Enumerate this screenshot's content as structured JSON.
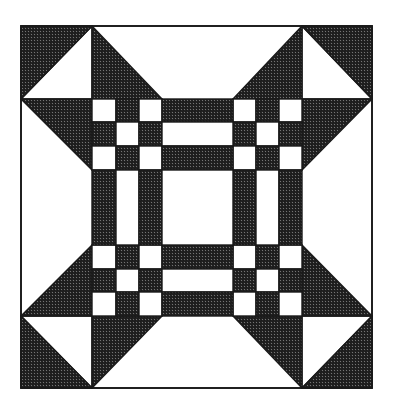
{
  "figure": {
    "canvas": {
      "width": 395,
      "height": 411
    },
    "colors": {
      "background": "#ffffff",
      "ink": "#1a1a1a",
      "hatch_fill": "#2a2a2a",
      "light_fill": "#ffffff"
    },
    "grid": {
      "columns_x": [
        21,
        92,
        116,
        139,
        162,
        233,
        256,
        279,
        302,
        372
      ],
      "rows_y": [
        26,
        99,
        122,
        146,
        170,
        245,
        269,
        292,
        316,
        388
      ]
    },
    "outer_square": {
      "x": 21,
      "y": 26,
      "w": 351,
      "h": 362
    },
    "corner_blocks": [
      {
        "name": "corner-top-left",
        "dark": [
          [
            21,
            26
          ],
          [
            92,
            26
          ],
          [
            21,
            99
          ]
        ],
        "light": [
          [
            92,
            26
          ],
          [
            92,
            99
          ],
          [
            21,
            99
          ]
        ]
      },
      {
        "name": "corner-top-right",
        "dark": [
          [
            302,
            26
          ],
          [
            372,
            26
          ],
          [
            372,
            99
          ]
        ],
        "light": [
          [
            302,
            26
          ],
          [
            302,
            99
          ],
          [
            372,
            99
          ]
        ]
      },
      {
        "name": "corner-bottom-left",
        "dark": [
          [
            21,
            316
          ],
          [
            21,
            388
          ],
          [
            92,
            388
          ]
        ],
        "light": [
          [
            21,
            316
          ],
          [
            92,
            316
          ],
          [
            92,
            388
          ]
        ]
      },
      {
        "name": "corner-bottom-right",
        "dark": [
          [
            372,
            316
          ],
          [
            372,
            388
          ],
          [
            302,
            388
          ]
        ],
        "light": [
          [
            302,
            316
          ],
          [
            372,
            316
          ],
          [
            302,
            388
          ]
        ]
      }
    ],
    "edge_triangles": [
      {
        "name": "top-left-triangle",
        "points": [
          [
            92,
            26
          ],
          [
            92,
            99
          ],
          [
            162,
            99
          ]
        ]
      },
      {
        "name": "top-right-triangle",
        "points": [
          [
            302,
            26
          ],
          [
            302,
            99
          ],
          [
            233,
            99
          ]
        ]
      },
      {
        "name": "bottom-left-triangle",
        "points": [
          [
            92,
            316
          ],
          [
            162,
            316
          ],
          [
            92,
            388
          ]
        ]
      },
      {
        "name": "bottom-right-triangle",
        "points": [
          [
            233,
            316
          ],
          [
            302,
            316
          ],
          [
            302,
            388
          ]
        ]
      },
      {
        "name": "left-top-triangle",
        "points": [
          [
            21,
            99
          ],
          [
            92,
            99
          ],
          [
            92,
            170
          ]
        ]
      },
      {
        "name": "left-bottom-triangle",
        "points": [
          [
            21,
            316
          ],
          [
            92,
            316
          ],
          [
            92,
            245
          ]
        ]
      },
      {
        "name": "right-top-triangle",
        "points": [
          [
            302,
            99
          ],
          [
            372,
            99
          ],
          [
            302,
            170
          ]
        ]
      },
      {
        "name": "right-bottom-triangle",
        "points": [
          [
            302,
            316
          ],
          [
            372,
            316
          ],
          [
            302,
            245
          ]
        ]
      }
    ],
    "nine_patches": [
      {
        "name": "nine-patch-top-left",
        "x": 92,
        "y": 99
      },
      {
        "name": "nine-patch-top-right",
        "x": 233,
        "y": 99
      },
      {
        "name": "nine-patch-bottom-left",
        "x": 92,
        "y": 245
      },
      {
        "name": "nine-patch-bottom-right",
        "x": 233,
        "y": 245
      }
    ],
    "nine_patch_layout": [
      [
        "light",
        "dark",
        "light"
      ],
      [
        "dark",
        "light",
        "dark"
      ],
      [
        "light",
        "dark",
        "light"
      ]
    ],
    "sashing": {
      "horizontal": [
        {
          "name": "sashing-top",
          "x": 162,
          "y": 99,
          "w": 71,
          "strips": [
            "dark",
            "light",
            "dark"
          ]
        },
        {
          "name": "sashing-bottom",
          "x": 162,
          "y": 245,
          "w": 71,
          "strips": [
            "dark",
            "light",
            "dark"
          ]
        }
      ],
      "vertical": [
        {
          "name": "sashing-left",
          "x": 92,
          "y": 170,
          "h": 75,
          "strips": [
            "dark",
            "light",
            "dark"
          ]
        },
        {
          "name": "sashing-right",
          "x": 233,
          "y": 170,
          "h": 75,
          "strips": [
            "dark",
            "light",
            "dark"
          ]
        }
      ]
    },
    "center_square": {
      "x": 162,
      "y": 170,
      "w": 71,
      "h": 75,
      "fill": "light"
    }
  }
}
